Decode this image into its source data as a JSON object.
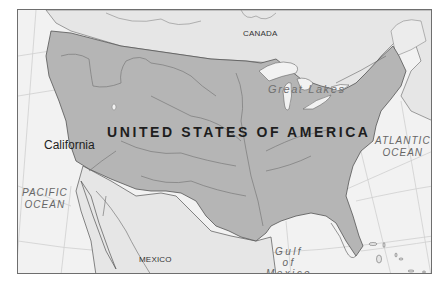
{
  "map": {
    "colors": {
      "usa_fill": "#b5b5b5",
      "land_fill": "#e6e6e6",
      "water_fill": "#f2f2f2",
      "border_stroke": "#555555",
      "river_stroke": "#7a7a7a",
      "grid_stroke": "#cfcfcf",
      "frame_stroke": "#6e6e6e"
    },
    "labels": {
      "country_main": "UNITED STATES OF AMERICA",
      "canada": "CANADA",
      "mexico": "MEXICO",
      "state": "California",
      "great_lakes": "Great Lakes",
      "atlantic_line1": "ATLANTIC",
      "atlantic_line2": "OCEAN",
      "pacific_line1": "PACIFIC",
      "pacific_line2": "OCEAN",
      "gulf_line1": "Gulf",
      "gulf_line2": "of",
      "gulf_line3": "Mexico"
    }
  }
}
